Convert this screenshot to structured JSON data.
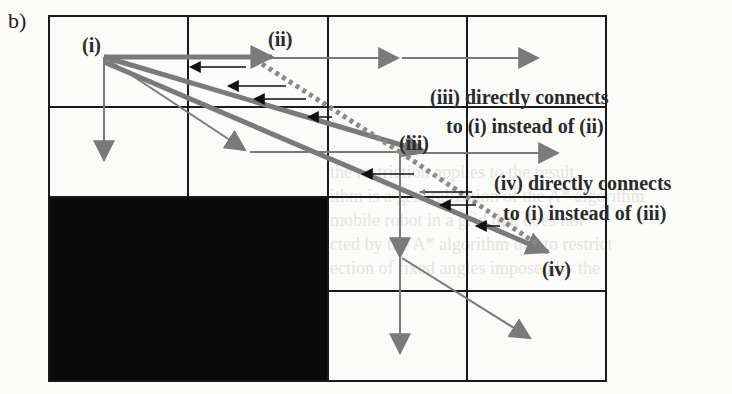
{
  "figure": {
    "panel_label": "b)",
    "colors": {
      "grid": "#1a1a1a",
      "obstacle": "#0a0a0a",
      "path_gray": "#7a7a7a",
      "back_pointer": "#111111",
      "background": "#fbfbf9"
    },
    "grid": {
      "columns": 4,
      "rows": 4,
      "obstacle_cells": "rows 3-4, columns 1-2"
    },
    "nodes": {
      "i": "(i)",
      "ii": "(ii)",
      "iii": "(iii)",
      "iv": "(iv)"
    },
    "annotations": [
      {
        "line1": "(iii) directly connects",
        "line2": "to (i) instead of (ii)"
      },
      {
        "line1": "(iv) directly connects",
        "line2": "to (i) instead of (iii)"
      }
    ],
    "background_bleed_text": [
      "the restriction applies to the result...",
      "ithm is a generalization of the A* algorithm",
      "mobile robot in a grid that does not",
      "cted by the A* algorithm due to restrict",
      "ection of fixed angles imposed by the"
    ]
  }
}
